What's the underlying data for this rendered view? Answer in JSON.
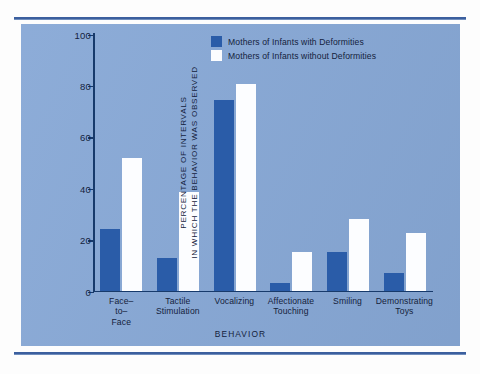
{
  "figure": {
    "panel_color": "#87a8d6",
    "rule_color": "#3b5f9e"
  },
  "legend": {
    "position": "top-right",
    "entries": [
      {
        "label": "Mothers of Infants with Deformities",
        "color": "#2a5ca8",
        "key": "with"
      },
      {
        "label": "Mothers of Infants without Deformities",
        "color": "#fcfdff",
        "key": "without"
      }
    ]
  },
  "chart_data": {
    "type": "bar",
    "title": "",
    "xlabel": "BEHAVIOR",
    "ylabel_lines": [
      "PERCENTAGE OF INTERVALS",
      "IN WHICH THE BEHAVIOR WAS OBSERVED"
    ],
    "ylim": [
      0,
      100
    ],
    "yticks": [
      0,
      20,
      40,
      60,
      80,
      100
    ],
    "grid": false,
    "categories": [
      "Face–\nto–\nFace",
      "Tactile\nStimulation",
      "Vocalizing",
      "Affectionate\nTouching",
      "Smiling",
      "Demonstrating\nToys"
    ],
    "series": [
      {
        "name": "Mothers of Infants with Deformities",
        "color": "#2a5ca8",
        "values": [
          24,
          12.5,
          74,
          3,
          15,
          7
        ]
      },
      {
        "name": "Mothers of Infants without Deformities",
        "color": "#fcfdff",
        "values": [
          51.5,
          38.5,
          80.5,
          15,
          28,
          22.5
        ]
      }
    ]
  }
}
